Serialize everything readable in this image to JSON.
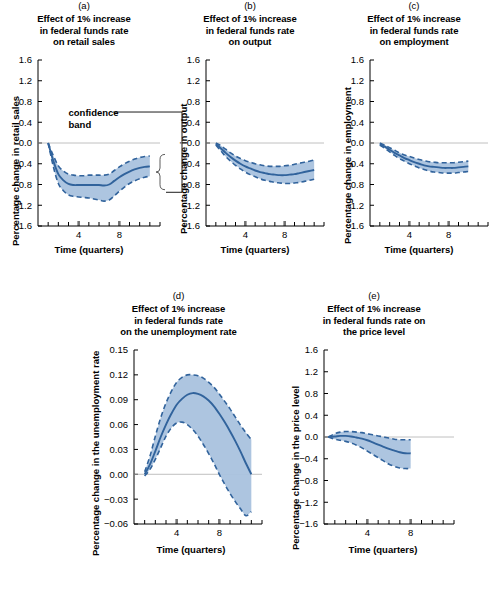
{
  "figure": {
    "panels": [
      {
        "key": "a",
        "letter": "(a)",
        "title_lines": [
          "Effect of 1% increase",
          "in federal funds rate",
          "on retail sales"
        ],
        "ylabel": "Percentage change in retail sales",
        "xlabel": "Time (quarters)",
        "annotation": "confidence\nband",
        "annotation_line1": "confidence",
        "annotation_line2": "band"
      },
      {
        "key": "b",
        "letter": "(b)",
        "title_lines": [
          "Effect of 1% increase",
          "in federal funds rate",
          "on output"
        ],
        "ylabel": "Percentage change in output",
        "xlabel": "Time (quarters)"
      },
      {
        "key": "c",
        "letter": "(c)",
        "title_lines": [
          "Effect of 1% increase",
          "in federal funds rate",
          "on employment"
        ],
        "ylabel": "Percentage change in employment",
        "xlabel": "Time (quarters)"
      },
      {
        "key": "d",
        "letter": "(d)",
        "title_lines": [
          "Effect of 1% increase",
          "in federal funds rate",
          "on the unemployment rate"
        ],
        "ylabel": "Percentage change in the unemployment rate",
        "xlabel": "Time (quarters)"
      },
      {
        "key": "e",
        "letter": "(e)",
        "title_lines": [
          "Effect of 1% increase",
          "in federal funds rate on",
          "the price level"
        ],
        "ylabel": "Percentage change in the price level",
        "xlabel": "Time (quarters)"
      }
    ]
  },
  "style": {
    "band_fill": "#a9c2de",
    "line_color": "#31639c",
    "dash_color": "#31639c",
    "axis_color": "#000000",
    "zero_line_color": "#b0b0b0"
  },
  "chart_data": [
    {
      "id": "a",
      "type": "line",
      "title": "(a) Effect of 1% increase in federal funds rate on retail sales",
      "xlabel": "Time (quarters)",
      "ylabel": "Percentage change in retail sales",
      "xlim": [
        0,
        12
      ],
      "ylim": [
        -1.6,
        1.6
      ],
      "yticks": [
        1.6,
        1.2,
        0.8,
        0.4,
        0.0,
        -0.4,
        -0.8,
        -1.2,
        -1.6
      ],
      "ytick_labels": [
        "1.6",
        "1.2",
        "0.8",
        "0.4",
        "0.0",
        "-0.4",
        "-0.8",
        "-1.2",
        "-1.6"
      ],
      "xticks_major": [
        4,
        8
      ],
      "xtick_labels": [
        "4",
        "8"
      ],
      "xticks_minor_step": 1,
      "grid": false,
      "zero_line": true,
      "annotations": [
        {
          "text": "confidence band",
          "target": "band",
          "x": 4.4,
          "y": 0.55
        }
      ],
      "series": [
        {
          "name": "point estimate",
          "style": "solid",
          "x": [
            1,
            1.5,
            2,
            2.5,
            3,
            3.5,
            4,
            4.5,
            5,
            5.5,
            6,
            6.5,
            7,
            7.5,
            8,
            8.5,
            9,
            9.5,
            10,
            10.5,
            11
          ],
          "values": [
            0.0,
            -0.34,
            -0.6,
            -0.72,
            -0.79,
            -0.81,
            -0.81,
            -0.81,
            -0.81,
            -0.81,
            -0.81,
            -0.82,
            -0.8,
            -0.73,
            -0.66,
            -0.6,
            -0.55,
            -0.51,
            -0.48,
            -0.46,
            -0.45
          ]
        },
        {
          "name": "upper confidence band",
          "style": "dashed",
          "x": [
            1,
            1.5,
            2,
            2.5,
            3,
            3.5,
            4,
            4.5,
            5,
            5.5,
            6,
            6.5,
            7,
            7.5,
            8,
            8.5,
            9,
            9.5,
            10,
            10.5,
            11
          ],
          "values": [
            0.0,
            -0.24,
            -0.44,
            -0.54,
            -0.6,
            -0.62,
            -0.63,
            -0.63,
            -0.62,
            -0.62,
            -0.62,
            -0.62,
            -0.6,
            -0.53,
            -0.46,
            -0.4,
            -0.35,
            -0.31,
            -0.28,
            -0.26,
            -0.25
          ]
        },
        {
          "name": "lower confidence band",
          "style": "dashed",
          "x": [
            1,
            1.5,
            2,
            2.5,
            3,
            3.5,
            4,
            4.5,
            5,
            5.5,
            6,
            6.5,
            7,
            7.5,
            8,
            8.5,
            9,
            9.5,
            10,
            10.5,
            11
          ],
          "values": [
            0.0,
            -0.45,
            -0.78,
            -0.92,
            -1.0,
            -1.03,
            -1.04,
            -1.05,
            -1.06,
            -1.08,
            -1.1,
            -1.12,
            -1.1,
            -1.02,
            -0.93,
            -0.85,
            -0.78,
            -0.73,
            -0.69,
            -0.66,
            -0.64
          ]
        }
      ]
    },
    {
      "id": "b",
      "type": "line",
      "title": "(b) Effect of 1% increase in federal funds rate on output",
      "xlabel": "Time (quarters)",
      "ylabel": "Percentage change in output",
      "xlim": [
        0,
        12
      ],
      "ylim": [
        -1.6,
        1.6
      ],
      "yticks": [
        1.6,
        1.2,
        0.8,
        0.4,
        0.0,
        -0.4,
        -0.8,
        -1.2,
        -1.6
      ],
      "ytick_labels": [
        "1.6",
        "1.2",
        "0.8",
        "0.4",
        "0.0",
        "-0.4",
        "-0.8",
        "-1.2",
        "-1.6"
      ],
      "xticks_major": [
        4,
        8
      ],
      "xtick_labels": [
        "4",
        "8"
      ],
      "grid": false,
      "zero_line": true,
      "series": [
        {
          "name": "point estimate",
          "style": "solid",
          "x": [
            1,
            1.5,
            2,
            2.5,
            3,
            3.5,
            4,
            4.5,
            5,
            5.5,
            6,
            6.5,
            7,
            7.5,
            8,
            8.5,
            9,
            9.5,
            10,
            10.5,
            11
          ],
          "values": [
            -0.02,
            -0.1,
            -0.19,
            -0.27,
            -0.34,
            -0.4,
            -0.45,
            -0.49,
            -0.53,
            -0.56,
            -0.58,
            -0.6,
            -0.61,
            -0.62,
            -0.62,
            -0.61,
            -0.6,
            -0.58,
            -0.56,
            -0.54,
            -0.52
          ]
        },
        {
          "name": "upper confidence band",
          "style": "dashed",
          "x": [
            1,
            1.5,
            2,
            2.5,
            3,
            3.5,
            4,
            4.5,
            5,
            5.5,
            6,
            6.5,
            7,
            7.5,
            8,
            8.5,
            9,
            9.5,
            10,
            10.5,
            11
          ],
          "values": [
            0.0,
            -0.05,
            -0.12,
            -0.19,
            -0.25,
            -0.3,
            -0.34,
            -0.37,
            -0.4,
            -0.42,
            -0.44,
            -0.45,
            -0.45,
            -0.45,
            -0.44,
            -0.43,
            -0.41,
            -0.39,
            -0.37,
            -0.35,
            -0.33
          ]
        },
        {
          "name": "lower confidence band",
          "style": "dashed",
          "x": [
            1,
            1.5,
            2,
            2.5,
            3,
            3.5,
            4,
            4.5,
            5,
            5.5,
            6,
            6.5,
            7,
            7.5,
            8,
            8.5,
            9,
            9.5,
            10,
            10.5,
            11
          ],
          "values": [
            -0.04,
            -0.15,
            -0.26,
            -0.35,
            -0.43,
            -0.5,
            -0.56,
            -0.61,
            -0.65,
            -0.69,
            -0.72,
            -0.74,
            -0.76,
            -0.77,
            -0.78,
            -0.78,
            -0.77,
            -0.76,
            -0.74,
            -0.72,
            -0.7
          ]
        }
      ]
    },
    {
      "id": "c",
      "type": "line",
      "title": "(c) Effect of 1% increase in federal funds rate on employment",
      "xlabel": "Time (quarters)",
      "ylabel": "Percentage change in employment",
      "xlim": [
        0,
        12
      ],
      "ylim": [
        -1.6,
        1.6
      ],
      "yticks": [
        1.6,
        1.2,
        0.8,
        0.4,
        0.0,
        -0.4,
        -0.8,
        -1.2,
        -1.6
      ],
      "ytick_labels": [
        "1.6",
        "1.2",
        "0.8",
        "0.4",
        "0.0",
        "-0.4",
        "-0.8",
        "-1.2",
        "-1.6"
      ],
      "xticks_major": [
        4,
        8
      ],
      "xtick_labels": [
        "4",
        "8"
      ],
      "grid": false,
      "zero_line": true,
      "series": [
        {
          "name": "point estimate",
          "style": "solid",
          "x": [
            1,
            1.5,
            2,
            2.5,
            3,
            3.5,
            4,
            4.5,
            5,
            5.5,
            6,
            6.5,
            7,
            7.5,
            8,
            8.5,
            9,
            9.5,
            10
          ],
          "values": [
            -0.02,
            -0.07,
            -0.13,
            -0.19,
            -0.24,
            -0.29,
            -0.33,
            -0.37,
            -0.4,
            -0.43,
            -0.45,
            -0.46,
            -0.47,
            -0.48,
            -0.48,
            -0.48,
            -0.47,
            -0.46,
            -0.45
          ]
        },
        {
          "name": "upper confidence band",
          "style": "dashed",
          "x": [
            1,
            1.5,
            2,
            2.5,
            3,
            3.5,
            4,
            4.5,
            5,
            5.5,
            6,
            6.5,
            7,
            7.5,
            8,
            8.5,
            9,
            9.5,
            10
          ],
          "values": [
            0.0,
            -0.04,
            -0.09,
            -0.14,
            -0.19,
            -0.23,
            -0.26,
            -0.29,
            -0.32,
            -0.34,
            -0.36,
            -0.37,
            -0.38,
            -0.38,
            -0.38,
            -0.38,
            -0.37,
            -0.36,
            -0.35
          ]
        },
        {
          "name": "lower confidence band",
          "style": "dashed",
          "x": [
            1,
            1.5,
            2,
            2.5,
            3,
            3.5,
            4,
            4.5,
            5,
            5.5,
            6,
            6.5,
            7,
            7.5,
            8,
            8.5,
            9,
            9.5,
            10
          ],
          "values": [
            -0.04,
            -0.1,
            -0.17,
            -0.24,
            -0.3,
            -0.35,
            -0.4,
            -0.44,
            -0.48,
            -0.51,
            -0.54,
            -0.56,
            -0.57,
            -0.58,
            -0.58,
            -0.58,
            -0.57,
            -0.56,
            -0.55
          ]
        }
      ]
    },
    {
      "id": "d",
      "type": "line",
      "title": "(d) Effect of 1% increase in federal funds rate on the unemployment rate",
      "xlabel": "Time (quarters)",
      "ylabel": "Percentage change in the unemployment rate",
      "xlim": [
        0,
        12
      ],
      "ylim": [
        -0.06,
        0.15
      ],
      "yticks": [
        0.15,
        0.12,
        0.09,
        0.06,
        0.03,
        0.0,
        -0.03,
        -0.06
      ],
      "ytick_labels": [
        "0.15",
        "0.12",
        "0.09",
        "0.06",
        "0.03",
        "0.00",
        "-0.03",
        "-0.06"
      ],
      "xticks_major": [
        4,
        8
      ],
      "xtick_labels": [
        "4",
        "8"
      ],
      "grid": false,
      "zero_line": true,
      "series": [
        {
          "name": "point estimate",
          "style": "solid",
          "x": [
            1,
            1.5,
            2,
            2.5,
            3,
            3.5,
            4,
            4.5,
            5,
            5.5,
            6,
            6.5,
            7,
            7.5,
            8,
            8.5,
            9,
            9.5,
            10,
            10.5,
            11
          ],
          "values": [
            0.0,
            0.012,
            0.028,
            0.045,
            0.06,
            0.073,
            0.084,
            0.091,
            0.096,
            0.098,
            0.097,
            0.094,
            0.089,
            0.082,
            0.073,
            0.063,
            0.052,
            0.04,
            0.027,
            0.013,
            0.0
          ]
        },
        {
          "name": "upper confidence band",
          "style": "dashed",
          "x": [
            1,
            1.5,
            2,
            2.5,
            3,
            3.5,
            4,
            4.5,
            5,
            5.5,
            6,
            6.5,
            7,
            7.5,
            8,
            8.5,
            9,
            9.5,
            10,
            10.5,
            11
          ],
          "values": [
            0.003,
            0.022,
            0.046,
            0.068,
            0.086,
            0.1,
            0.111,
            0.117,
            0.12,
            0.12,
            0.119,
            0.116,
            0.111,
            0.105,
            0.097,
            0.088,
            0.079,
            0.069,
            0.059,
            0.05,
            0.042
          ]
        },
        {
          "name": "lower confidence band",
          "style": "dashed",
          "x": [
            1,
            1.5,
            2,
            2.5,
            3,
            3.5,
            4,
            4.5,
            5,
            5.5,
            6,
            6.5,
            7,
            7.5,
            8,
            8.5,
            9,
            9.5,
            10,
            10.5,
            11
          ],
          "values": [
            -0.002,
            0.006,
            0.018,
            0.032,
            0.046,
            0.056,
            0.062,
            0.063,
            0.06,
            0.054,
            0.046,
            0.036,
            0.025,
            0.013,
            0.0,
            -0.012,
            -0.023,
            -0.033,
            -0.042,
            -0.05,
            -0.045
          ]
        }
      ]
    },
    {
      "id": "e",
      "type": "line",
      "title": "(e) Effect of 1% increase in federal funds rate on the price level",
      "xlabel": "Time (quarters)",
      "ylabel": "Percentage change in the price level",
      "xlim": [
        0,
        12
      ],
      "ylim": [
        -1.6,
        1.6
      ],
      "yticks": [
        1.6,
        1.2,
        0.8,
        0.4,
        0.0,
        -0.4,
        -0.8,
        -1.2,
        -1.6
      ],
      "ytick_labels": [
        "1.6",
        "1.2",
        "0.8",
        "0.4",
        "0.0",
        "-0.4",
        "-0.8",
        "-1.2",
        "-1.6"
      ],
      "xticks_major": [
        4,
        8
      ],
      "xtick_labels": [
        "4",
        "8"
      ],
      "grid": false,
      "zero_line": true,
      "series": [
        {
          "name": "point estimate",
          "style": "solid",
          "x": [
            0.4,
            1,
            1.5,
            2,
            2.5,
            3,
            3.5,
            4,
            4.5,
            5,
            5.5,
            6,
            6.5,
            7,
            7.5,
            8
          ],
          "values": [
            0.0,
            0.01,
            0.02,
            0.02,
            0.01,
            -0.01,
            -0.03,
            -0.06,
            -0.1,
            -0.14,
            -0.18,
            -0.22,
            -0.25,
            -0.28,
            -0.3,
            -0.3
          ]
        },
        {
          "name": "upper confidence band",
          "style": "dashed",
          "x": [
            0.4,
            1,
            1.5,
            2,
            2.5,
            3,
            3.5,
            4,
            4.5,
            5,
            5.5,
            6,
            6.5,
            7,
            7.5,
            8
          ],
          "values": [
            0.0,
            0.06,
            0.09,
            0.1,
            0.1,
            0.09,
            0.08,
            0.06,
            0.04,
            0.02,
            0.0,
            -0.02,
            -0.04,
            -0.05,
            -0.05,
            -0.05
          ]
        },
        {
          "name": "lower confidence band",
          "style": "dashed",
          "x": [
            0.4,
            1,
            1.5,
            2,
            2.5,
            3,
            3.5,
            4,
            4.5,
            5,
            5.5,
            6,
            6.5,
            7,
            7.5,
            8
          ],
          "values": [
            0.0,
            -0.04,
            -0.06,
            -0.08,
            -0.11,
            -0.15,
            -0.2,
            -0.26,
            -0.32,
            -0.38,
            -0.44,
            -0.5,
            -0.54,
            -0.57,
            -0.58,
            -0.58
          ]
        }
      ]
    }
  ]
}
